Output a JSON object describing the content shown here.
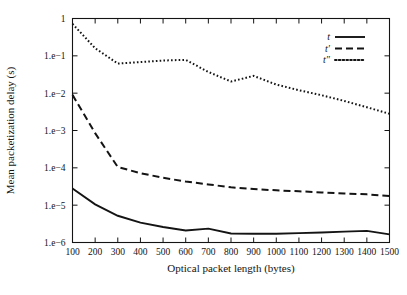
{
  "chart_data": {
    "type": "line",
    "title": "",
    "xlabel": "Optical packet length (bytes)",
    "ylabel": "Mean packetization delay (s)",
    "yscale": "log",
    "xlim": [
      100,
      1500
    ],
    "ylim": [
      1e-06,
      1
    ],
    "grid": false,
    "legend_position": "top-right",
    "x": [
      100,
      200,
      300,
      400,
      500,
      600,
      700,
      800,
      900,
      1000,
      1100,
      1200,
      1300,
      1400,
      1500
    ],
    "xticklabels": [
      "100",
      "200",
      "300",
      "400",
      "500",
      "600",
      "700",
      "800",
      "900",
      "1000",
      "1100",
      "1200",
      "1300",
      "1400",
      "1500"
    ],
    "yticks": [
      1,
      0.1,
      0.01,
      0.001,
      0.0001,
      1e-05,
      1e-06
    ],
    "yticklabels": [
      "1",
      "1.e−1",
      "1.e−2",
      "1.e−3",
      "1.e−4",
      "1.e−5",
      "1.e−6"
    ],
    "series": [
      {
        "name": "t",
        "style": "solid",
        "values": [
          2.8e-05,
          1.05e-05,
          5.2e-06,
          3.4e-06,
          2.6e-06,
          2.1e-06,
          2.35e-06,
          1.75e-06,
          1.72e-06,
          1.72e-06,
          1.78e-06,
          1.85e-06,
          1.95e-06,
          2.05e-06,
          1.65e-06
        ]
      },
      {
        "name": "t′",
        "style": "dashed",
        "values": [
          0.009,
          0.00085,
          0.000105,
          7.2e-05,
          5.4e-05,
          4.3e-05,
          3.6e-05,
          3e-05,
          2.7e-05,
          2.5e-05,
          2.35e-05,
          2.2e-05,
          2.05e-05,
          1.95e-05,
          1.75e-05
        ]
      },
      {
        "name": "t″",
        "style": "dotted",
        "values": [
          0.72,
          0.16,
          0.062,
          0.068,
          0.075,
          0.078,
          0.037,
          0.0205,
          0.029,
          0.017,
          0.012,
          0.0088,
          0.0062,
          0.0042,
          0.0028
        ]
      }
    ]
  },
  "legend": {
    "entries": [
      {
        "label": "t",
        "style": "solid"
      },
      {
        "label": "t′",
        "style": "dashed"
      },
      {
        "label": "t″",
        "style": "dotted"
      }
    ]
  }
}
